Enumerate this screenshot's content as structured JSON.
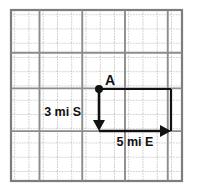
{
  "figure": {
    "background_color": "#ffffff",
    "grid": {
      "name": "graph-paper-grid",
      "columns": 12,
      "rows": 12,
      "cell_size_px": 14.25,
      "origin_x_px": 11,
      "origin_y_px": 10,
      "minor_line_color": "#b9b9b9",
      "major_line_color": "#8c8c8c",
      "border_color": "#7d7d7d"
    },
    "points": [
      {
        "id": "A",
        "label": "A",
        "label_offset_x": 6,
        "label_offset_y": -4,
        "grid_col": 6,
        "grid_row": 5.5,
        "x_px": 99,
        "y_px": 89,
        "dot_radius_px": 4,
        "color": "#111111"
      }
    ],
    "vectors": [
      {
        "id": "south-vector",
        "name": "vector-south",
        "label": "3 mi S",
        "magnitude": 3,
        "unit": "mi",
        "direction": "S",
        "from_x_px": 99,
        "from_y_px": 89,
        "to_x_px": 99,
        "to_y_px": 131,
        "label_x_px": 81,
        "label_y_px": 116,
        "label_anchor": "end",
        "color": "#111111",
        "stroke_width": 2.6
      },
      {
        "id": "east-vector",
        "name": "vector-east",
        "label": "5 mi E",
        "magnitude": 5,
        "unit": "mi",
        "direction": "E",
        "from_x_px": 99,
        "from_y_px": 131,
        "to_x_px": 171,
        "to_y_px": 131,
        "label_x_px": 135,
        "label_y_px": 146,
        "label_anchor": "middle",
        "color": "#111111",
        "stroke_width": 2.6
      }
    ],
    "guide_lines": [
      {
        "id": "top-guide",
        "name": "guide-line-top",
        "x1_px": 99,
        "y1_px": 89,
        "x2_px": 171,
        "y2_px": 89,
        "color": "#111111",
        "stroke_width": 2.2
      },
      {
        "id": "right-guide",
        "name": "guide-line-right",
        "x1_px": 171,
        "y1_px": 89,
        "x2_px": 171,
        "y2_px": 131,
        "color": "#111111",
        "stroke_width": 2.2
      }
    ],
    "arrowhead": {
      "width_px": 11,
      "half_height_px": 6,
      "color": "#111111"
    }
  }
}
